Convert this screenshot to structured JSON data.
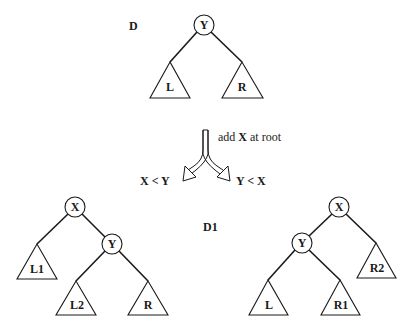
{
  "diagram": {
    "top_tree": {
      "label": "D",
      "root": "Y",
      "left_subtree": "L",
      "right_subtree": "R"
    },
    "operation": {
      "text_prefix": "add ",
      "text_key": "X",
      "text_suffix": " at root",
      "left_condition": "X < Y",
      "right_condition": "Y < X"
    },
    "result_label": "D1",
    "left_tree": {
      "root": "X",
      "left_subtree": "L1",
      "right_child": "Y",
      "right_child_left_subtree": "L2",
      "right_child_right_subtree": "R"
    },
    "right_tree": {
      "root": "X",
      "left_child": "Y",
      "right_subtree": "R2",
      "left_child_left_subtree": "L",
      "left_child_right_subtree": "R1"
    }
  }
}
